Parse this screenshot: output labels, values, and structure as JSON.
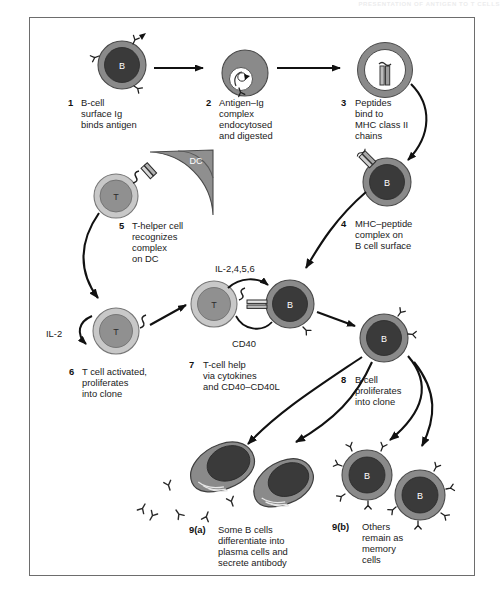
{
  "page": {
    "running_head": "PRESENTATION OF ANTIGEN TO T CELLS",
    "figure_border_color": "#6d6d6d",
    "background": "#ffffff"
  },
  "palette": {
    "b_cell_core": "#3a3a3a",
    "b_cell_rim": "#8a8a8a",
    "t_cell_core": "#909090",
    "t_cell_rim": "#c8c8c8",
    "dc_fill": "#8f8f8f",
    "plasma_cell_body": "#8a8a8a",
    "plasma_cell_nucleus": "#3a3a3a",
    "arrow_color": "#111111",
    "outline": "#4a4a4a"
  },
  "steps": [
    {
      "id": "step-1",
      "number": "1",
      "lines": [
        "B-cell",
        "surface Ig",
        "binds antigen"
      ],
      "cell_label": "B",
      "cell_type": "b-cell"
    },
    {
      "id": "step-2",
      "number": "2",
      "lines": [
        "Antigen–Ig",
        "complex",
        "endocytosed",
        "and digested"
      ],
      "cell_label": "",
      "cell_type": "b-cell-endosome"
    },
    {
      "id": "step-3",
      "number": "3",
      "lines": [
        "Peptides",
        "bind to",
        "MHC class II",
        "chains"
      ],
      "cell_label": "",
      "cell_type": "b-cell-ring"
    },
    {
      "id": "step-4",
      "number": "4",
      "lines": [
        "MHC–peptide",
        "complex on",
        "B cell surface"
      ],
      "cell_label": "B",
      "cell_type": "b-cell"
    },
    {
      "id": "step-5",
      "number": "5",
      "lines": [
        "T-helper cell",
        "recognizes",
        "complex",
        "on DC"
      ],
      "cell_label": "T",
      "cell_type": "t-cell"
    },
    {
      "id": "step-6",
      "number": "6",
      "lines": [
        "T cell activated,",
        "proliferates",
        "into clone"
      ],
      "cell_label": "T",
      "cell_type": "t-cell"
    },
    {
      "id": "step-7",
      "number": "7",
      "lines": [
        "T-cell help",
        "via cytokines",
        "and CD40–CD40L"
      ],
      "cell_label_left": "T",
      "cell_label_right": "B",
      "cell_type": "t-b-conjugate"
    },
    {
      "id": "step-8",
      "number": "8",
      "lines": [
        "B cell",
        "proliferates",
        "into clone"
      ],
      "cell_label": "B",
      "cell_type": "b-cell"
    },
    {
      "id": "step-9a",
      "number": "9(a)",
      "lines": [
        "Some B cells",
        "differentiate into",
        "plasma cells and",
        "secrete antibody"
      ],
      "cell_label": "",
      "cell_type": "plasma-cells"
    },
    {
      "id": "step-9b",
      "number": "9(b)",
      "lines": [
        "Others",
        "remain as",
        "memory",
        "cells"
      ],
      "cell_label": "B",
      "cell_type": "memory-b-cells"
    }
  ],
  "annotations": {
    "dc_label": "DC",
    "il2_label": "IL-2",
    "cytokines_label": "IL-2,4,5,6",
    "cd40_label": "CD40"
  }
}
